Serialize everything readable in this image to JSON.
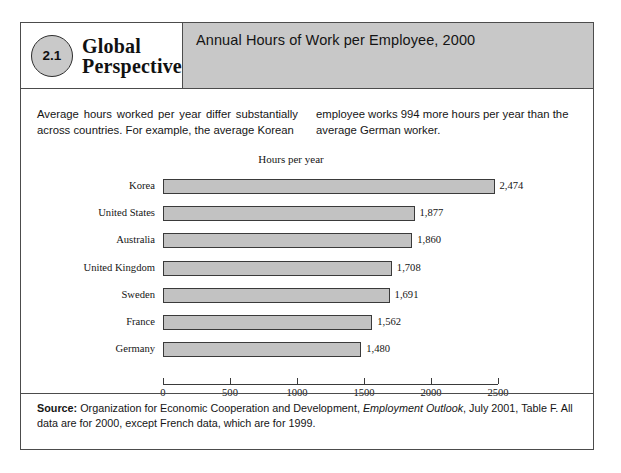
{
  "figure": {
    "number": "2.1",
    "series_title_line1": "Global",
    "series_title_line2": "Perspective",
    "title": "Annual Hours of Work per Employee, 2000"
  },
  "intro": {
    "left_column": "Average hours worked per year differ substantially across countries. For example, the average Korean",
    "right_column": "employee works 994 more hours per year than the average German worker."
  },
  "source": {
    "label": "Source:",
    "text_part1": " Organization for Economic Cooperation and Development, ",
    "italic_title": "Employment Outlook",
    "text_part2": ", July 2001, Table F. All data are for 2000, except French data, which are for 1999."
  },
  "colors": {
    "header_panel": "#c8c8c8",
    "badge_fill": "#c9c9c9",
    "bar_fill": "#c2c2c2",
    "bar_border": "#3a3a3a",
    "frame_border": "#4c4c4c"
  },
  "chart_data": {
    "type": "bar",
    "orientation": "horizontal",
    "title": "Annual Hours of Work per Employee, 2000",
    "subtitle": "",
    "xlabel": "Hours per year",
    "ylabel": "",
    "axis_title_position": "top",
    "grid": false,
    "legend": false,
    "xlim": [
      0,
      2500
    ],
    "xticks": [
      0,
      500,
      1000,
      1500,
      2000,
      2500
    ],
    "xtick_labels": [
      "0",
      "500",
      "1000",
      "1500",
      "2000",
      "2500"
    ],
    "categories": [
      "Korea",
      "United States",
      "Australia",
      "United Kingdom",
      "Sweden",
      "France",
      "Germany"
    ],
    "values": [
      2474,
      1877,
      1860,
      1708,
      1691,
      1562,
      1480
    ],
    "value_labels": [
      "2,474",
      "1,877",
      "1,860",
      "1,708",
      "1,691",
      "1,562",
      "1,480"
    ]
  }
}
